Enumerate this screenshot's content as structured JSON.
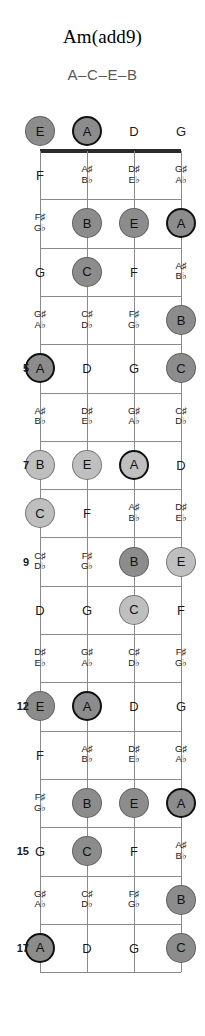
{
  "title": "Am(add9)",
  "notes_line": "A–C–E–B",
  "colors": {
    "root": "#8c8c8c",
    "root_border": "#111111",
    "chord_tone_dark": "#8c8c8c",
    "chord_tone_light": "#bfbfbf",
    "nut": "#2b2b2b",
    "fretline": "#8a8a8a",
    "text": "#1a1a1a",
    "subtitle": "#595959"
  },
  "geometry": {
    "left_x": 40,
    "string_spacing": 47,
    "nut_y": 151,
    "fret_spacing": 48.3,
    "open_label_y": 131,
    "marker_radius": 15,
    "num_strings": 4,
    "num_frets": 17
  },
  "strings": [
    "E",
    "A",
    "D",
    "G"
  ],
  "open_row": [
    {
      "label": "E",
      "marker": true,
      "shade": "chord_tone_dark",
      "root": false
    },
    {
      "label": "A",
      "marker": true,
      "shade": "chord_tone_dark",
      "root": true
    },
    {
      "label": "D",
      "marker": false,
      "shade": null,
      "root": false
    },
    {
      "label": "G",
      "marker": false,
      "shade": null,
      "root": false
    }
  ],
  "fret_numbers": [
    {
      "fret": 5,
      "label": "5"
    },
    {
      "fret": 7,
      "label": "7"
    },
    {
      "fret": 9,
      "label": "9"
    },
    {
      "fret": 12,
      "label": "12"
    },
    {
      "fret": 15,
      "label": "15"
    },
    {
      "fret": 17,
      "label": "17"
    }
  ],
  "frets": [
    {
      "fret": 1,
      "cells": [
        {
          "label": "F",
          "acc": false,
          "marker": false,
          "shade": null,
          "root": false
        },
        {
          "label": "A♯\nB♭",
          "acc": true,
          "marker": false,
          "shade": null,
          "root": false
        },
        {
          "label": "D♯\nE♭",
          "acc": true,
          "marker": false,
          "shade": null,
          "root": false
        },
        {
          "label": "G♯\nA♭",
          "acc": true,
          "marker": false,
          "shade": null,
          "root": false
        }
      ]
    },
    {
      "fret": 2,
      "cells": [
        {
          "label": "F♯\nG♭",
          "acc": true,
          "marker": false,
          "shade": null,
          "root": false
        },
        {
          "label": "B",
          "acc": false,
          "marker": true,
          "shade": "chord_tone_dark",
          "root": false
        },
        {
          "label": "E",
          "acc": false,
          "marker": true,
          "shade": "chord_tone_dark",
          "root": false
        },
        {
          "label": "A",
          "acc": false,
          "marker": true,
          "shade": "chord_tone_dark",
          "root": true
        }
      ]
    },
    {
      "fret": 3,
      "cells": [
        {
          "label": "G",
          "acc": false,
          "marker": false,
          "shade": null,
          "root": false
        },
        {
          "label": "C",
          "acc": false,
          "marker": true,
          "shade": "chord_tone_dark",
          "root": false
        },
        {
          "label": "F",
          "acc": false,
          "marker": false,
          "shade": null,
          "root": false
        },
        {
          "label": "A♯\nB♭",
          "acc": true,
          "marker": false,
          "shade": null,
          "root": false
        }
      ]
    },
    {
      "fret": 4,
      "cells": [
        {
          "label": "G♯\nA♭",
          "acc": true,
          "marker": false,
          "shade": null,
          "root": false
        },
        {
          "label": "C♯\nD♭",
          "acc": true,
          "marker": false,
          "shade": null,
          "root": false
        },
        {
          "label": "F♯\nG♭",
          "acc": true,
          "marker": false,
          "shade": null,
          "root": false
        },
        {
          "label": "B",
          "acc": false,
          "marker": true,
          "shade": "chord_tone_dark",
          "root": false
        }
      ]
    },
    {
      "fret": 5,
      "cells": [
        {
          "label": "A",
          "acc": false,
          "marker": true,
          "shade": "chord_tone_dark",
          "root": true
        },
        {
          "label": "D",
          "acc": false,
          "marker": false,
          "shade": null,
          "root": false
        },
        {
          "label": "G",
          "acc": false,
          "marker": false,
          "shade": null,
          "root": false
        },
        {
          "label": "C",
          "acc": false,
          "marker": true,
          "shade": "chord_tone_dark",
          "root": false
        }
      ]
    },
    {
      "fret": 6,
      "cells": [
        {
          "label": "A♯\nB♭",
          "acc": true,
          "marker": false,
          "shade": null,
          "root": false
        },
        {
          "label": "D♯\nE♭",
          "acc": true,
          "marker": false,
          "shade": null,
          "root": false
        },
        {
          "label": "G♯\nA♭",
          "acc": true,
          "marker": false,
          "shade": null,
          "root": false
        },
        {
          "label": "C♯\nD♭",
          "acc": true,
          "marker": false,
          "shade": null,
          "root": false
        }
      ]
    },
    {
      "fret": 7,
      "cells": [
        {
          "label": "B",
          "acc": false,
          "marker": true,
          "shade": "chord_tone_light",
          "root": false
        },
        {
          "label": "E",
          "acc": false,
          "marker": true,
          "shade": "chord_tone_light",
          "root": false
        },
        {
          "label": "A",
          "acc": false,
          "marker": true,
          "shade": "chord_tone_light",
          "root": true
        },
        {
          "label": "D",
          "acc": false,
          "marker": false,
          "shade": null,
          "root": false
        }
      ]
    },
    {
      "fret": 8,
      "cells": [
        {
          "label": "C",
          "acc": false,
          "marker": true,
          "shade": "chord_tone_light",
          "root": false
        },
        {
          "label": "F",
          "acc": false,
          "marker": false,
          "shade": null,
          "root": false
        },
        {
          "label": "A♯\nB♭",
          "acc": true,
          "marker": false,
          "shade": null,
          "root": false
        },
        {
          "label": "D♯\nE♭",
          "acc": true,
          "marker": false,
          "shade": null,
          "root": false
        }
      ]
    },
    {
      "fret": 9,
      "cells": [
        {
          "label": "C♯\nD♭",
          "acc": true,
          "marker": false,
          "shade": null,
          "root": false
        },
        {
          "label": "F♯\nG♭",
          "acc": true,
          "marker": false,
          "shade": null,
          "root": false
        },
        {
          "label": "B",
          "acc": false,
          "marker": true,
          "shade": "chord_tone_dark",
          "root": false
        },
        {
          "label": "E",
          "acc": false,
          "marker": true,
          "shade": "chord_tone_light",
          "root": false
        }
      ]
    },
    {
      "fret": 10,
      "cells": [
        {
          "label": "D",
          "acc": false,
          "marker": false,
          "shade": null,
          "root": false
        },
        {
          "label": "G",
          "acc": false,
          "marker": false,
          "shade": null,
          "root": false
        },
        {
          "label": "C",
          "acc": false,
          "marker": true,
          "shade": "chord_tone_light",
          "root": false
        },
        {
          "label": "F",
          "acc": false,
          "marker": false,
          "shade": null,
          "root": false
        }
      ]
    },
    {
      "fret": 11,
      "cells": [
        {
          "label": "D♯\nE♭",
          "acc": true,
          "marker": false,
          "shade": null,
          "root": false
        },
        {
          "label": "G♯\nA♭",
          "acc": true,
          "marker": false,
          "shade": null,
          "root": false
        },
        {
          "label": "C♯\nD♭",
          "acc": true,
          "marker": false,
          "shade": null,
          "root": false
        },
        {
          "label": "F♯\nG♭",
          "acc": true,
          "marker": false,
          "shade": null,
          "root": false
        }
      ]
    },
    {
      "fret": 12,
      "cells": [
        {
          "label": "E",
          "acc": false,
          "marker": true,
          "shade": "chord_tone_dark",
          "root": false
        },
        {
          "label": "A",
          "acc": false,
          "marker": true,
          "shade": "chord_tone_dark",
          "root": true
        },
        {
          "label": "D",
          "acc": false,
          "marker": false,
          "shade": null,
          "root": false
        },
        {
          "label": "G",
          "acc": false,
          "marker": false,
          "shade": null,
          "root": false
        }
      ]
    },
    {
      "fret": 13,
      "cells": [
        {
          "label": "F",
          "acc": false,
          "marker": false,
          "shade": null,
          "root": false
        },
        {
          "label": "A♯\nB♭",
          "acc": true,
          "marker": false,
          "shade": null,
          "root": false
        },
        {
          "label": "D♯\nE♭",
          "acc": true,
          "marker": false,
          "shade": null,
          "root": false
        },
        {
          "label": "G♯\nA♭",
          "acc": true,
          "marker": false,
          "shade": null,
          "root": false
        }
      ]
    },
    {
      "fret": 14,
      "cells": [
        {
          "label": "F♯\nG♭",
          "acc": true,
          "marker": false,
          "shade": null,
          "root": false
        },
        {
          "label": "B",
          "acc": false,
          "marker": true,
          "shade": "chord_tone_dark",
          "root": false
        },
        {
          "label": "E",
          "acc": false,
          "marker": true,
          "shade": "chord_tone_dark",
          "root": false
        },
        {
          "label": "A",
          "acc": false,
          "marker": true,
          "shade": "chord_tone_dark",
          "root": true
        }
      ]
    },
    {
      "fret": 15,
      "cells": [
        {
          "label": "G",
          "acc": false,
          "marker": false,
          "shade": null,
          "root": false
        },
        {
          "label": "C",
          "acc": false,
          "marker": true,
          "shade": "chord_tone_dark",
          "root": false
        },
        {
          "label": "F",
          "acc": false,
          "marker": false,
          "shade": null,
          "root": false
        },
        {
          "label": "A♯\nB♭",
          "acc": true,
          "marker": false,
          "shade": null,
          "root": false
        }
      ]
    },
    {
      "fret": 16,
      "cells": [
        {
          "label": "G♯\nA♭",
          "acc": true,
          "marker": false,
          "shade": null,
          "root": false
        },
        {
          "label": "C♯\nD♭",
          "acc": true,
          "marker": false,
          "shade": null,
          "root": false
        },
        {
          "label": "F♯\nG♭",
          "acc": true,
          "marker": false,
          "shade": null,
          "root": false
        },
        {
          "label": "B",
          "acc": false,
          "marker": true,
          "shade": "chord_tone_dark",
          "root": false
        }
      ]
    },
    {
      "fret": 17,
      "cells": [
        {
          "label": "A",
          "acc": false,
          "marker": true,
          "shade": "chord_tone_dark",
          "root": true
        },
        {
          "label": "D",
          "acc": false,
          "marker": false,
          "shade": null,
          "root": false
        },
        {
          "label": "G",
          "acc": false,
          "marker": false,
          "shade": null,
          "root": false
        },
        {
          "label": "C",
          "acc": false,
          "marker": true,
          "shade": "chord_tone_dark",
          "root": false
        }
      ]
    }
  ]
}
